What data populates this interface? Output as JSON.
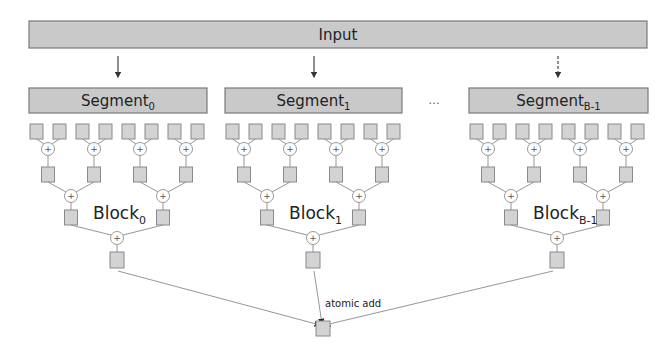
{
  "figure": {
    "input_label": "Input",
    "ellipsis": "…",
    "segments": [
      {
        "name": "Segment",
        "sub": "0",
        "x": 29,
        "w": 178
      },
      {
        "name": "Segment",
        "sub": "1",
        "x": 225,
        "w": 177
      },
      {
        "name": "Segment",
        "sub": "B-1",
        "x": 469,
        "w": 179
      }
    ],
    "blocks": [
      {
        "name": "Block",
        "sub": "0",
        "leaf_x0": 30,
        "root_cx": 118,
        "arrow_style": "solid"
      },
      {
        "name": "Block",
        "sub": "1",
        "leaf_x0": 226,
        "root_cx": 314,
        "arrow_style": "solid"
      },
      {
        "name": "Block",
        "sub": "B-1",
        "leaf_x0": 470,
        "root_cx": 558,
        "arrow_style": "dashed"
      }
    ],
    "reduction_op": "+",
    "atomic_label": "atomic add",
    "colors": {
      "bar_fill": "#c9c9c9",
      "cell_fill": "#d3d3d3",
      "stroke": "#7a7a7a"
    }
  }
}
